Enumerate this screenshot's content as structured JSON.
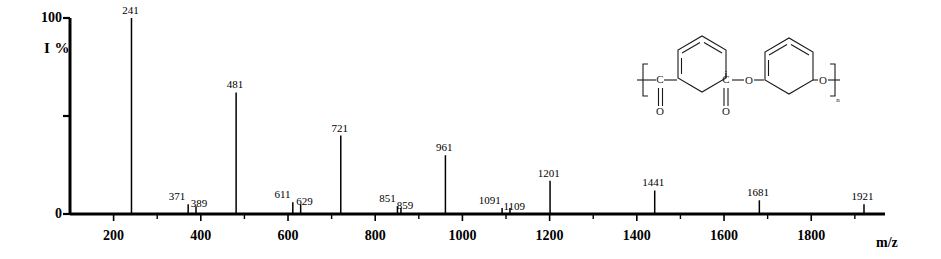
{
  "axes": {
    "ylabel": "I %",
    "ytick_labels": [
      "100",
      "0"
    ],
    "xaxis_title": "m/z",
    "xtick_labels": [
      "200",
      "400",
      "600",
      "800",
      "1000",
      "1200",
      "1400",
      "1600",
      "1800"
    ]
  },
  "structure": {
    "name": "poly(resorcinol phthalate) repeat unit",
    "atom_labels": [
      "C",
      "O",
      "C",
      "O",
      "O",
      "O"
    ],
    "repeat_subscript": "n",
    "bracket_left": "[",
    "bracket_right": "]"
  },
  "chart_data": {
    "type": "bar",
    "title": "",
    "xlabel": "m/z",
    "ylabel": "I %",
    "xlim": [
      100,
      1960
    ],
    "ylim": [
      0,
      100
    ],
    "grid": false,
    "legend": "none",
    "xticks_major": [
      200,
      400,
      600,
      800,
      1000,
      1200,
      1400,
      1600,
      1800
    ],
    "xticks_minor": [
      300,
      500,
      700,
      900,
      1100,
      1300,
      1500,
      1700,
      1900
    ],
    "yticks": [
      0,
      50,
      100
    ],
    "ytick_labels_shown": [
      "100",
      "0"
    ],
    "series": [
      {
        "name": "relative intensity",
        "points": [
          {
            "mz": 241,
            "intensity": 100,
            "label": "241"
          },
          {
            "mz": 371,
            "intensity": 5,
            "label": "371"
          },
          {
            "mz": 389,
            "intensity": 4,
            "label": "389"
          },
          {
            "mz": 481,
            "intensity": 62,
            "label": "481"
          },
          {
            "mz": 611,
            "intensity": 6,
            "label": "611"
          },
          {
            "mz": 629,
            "intensity": 5,
            "label": "629"
          },
          {
            "mz": 721,
            "intensity": 40,
            "label": "721"
          },
          {
            "mz": 851,
            "intensity": 4,
            "label": "851"
          },
          {
            "mz": 859,
            "intensity": 3,
            "label": "859"
          },
          {
            "mz": 961,
            "intensity": 30,
            "label": "961"
          },
          {
            "mz": 1091,
            "intensity": 3,
            "label": "1091"
          },
          {
            "mz": 1109,
            "intensity": 3,
            "label": "1109"
          },
          {
            "mz": 1201,
            "intensity": 17,
            "label": "1201"
          },
          {
            "mz": 1441,
            "intensity": 12,
            "label": "1441"
          },
          {
            "mz": 1681,
            "intensity": 7,
            "label": "1681"
          },
          {
            "mz": 1921,
            "intensity": 5,
            "label": "1921"
          }
        ]
      }
    ]
  }
}
